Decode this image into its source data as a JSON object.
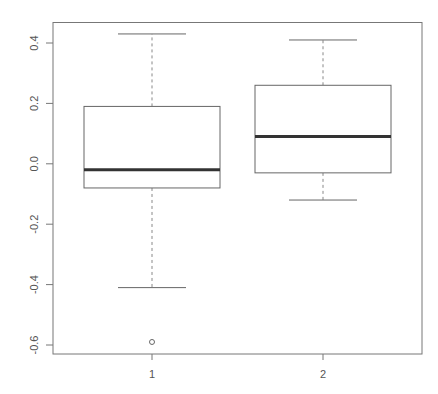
{
  "chart_data": {
    "type": "box",
    "title": "",
    "xlabel": "",
    "ylabel": "",
    "categories": [
      "1",
      "2"
    ],
    "ylim": [
      -0.63,
      0.47
    ],
    "yticks": [
      0.4,
      0.2,
      0.0,
      -0.2,
      -0.4,
      -0.6
    ],
    "ytick_labels": [
      "0.4",
      "0.2",
      "0.0",
      "-0.2",
      "-0.4",
      "-0.6"
    ],
    "grid": false,
    "legend": null,
    "series": [
      {
        "name": "1",
        "whisker_low": -0.41,
        "q1": -0.08,
        "median": -0.02,
        "q3": 0.19,
        "whisker_high": 0.43,
        "outliers": [
          -0.59
        ]
      },
      {
        "name": "2",
        "whisker_low": -0.12,
        "q1": -0.03,
        "median": 0.09,
        "q3": 0.26,
        "whisker_high": 0.41,
        "outliers": []
      }
    ]
  },
  "colors": {
    "frame": "#777777",
    "box": "#666666",
    "median": "#333333",
    "whisker": "#888888",
    "text": "#555555"
  }
}
